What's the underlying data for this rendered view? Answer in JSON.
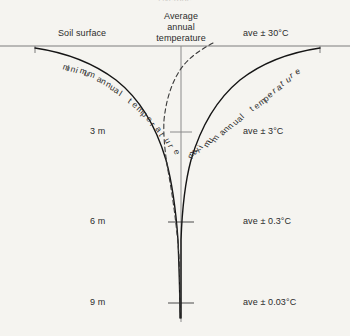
{
  "figure": {
    "background_color": "#f5f4f0",
    "ink_color": "#1a1a1a",
    "axis_color": "#8a8a8a",
    "top_clipped_text": "Average",
    "surface_label": "Soil surface",
    "average_label_lines": [
      "Average",
      "annual",
      "temperature"
    ],
    "curve_labels": {
      "minimum": "minimum annual temperature",
      "maximum": "maximum annual temperature"
    },
    "depth_labels": [
      {
        "label": "3 m",
        "amplitude": "ave ± 3°C"
      },
      {
        "label": "6 m",
        "amplitude": "ave ± 0.3°C"
      },
      {
        "label": "9 m",
        "amplitude": "ave ± 0.03°C"
      }
    ],
    "surface_amplitude": "ave ± 30°C"
  },
  "chart_data": {
    "type": "line",
    "title": "",
    "xlabel": "Temperature",
    "ylabel": "Depth",
    "ylim": [
      0,
      9.6
    ],
    "xlim": [
      -30,
      30
    ],
    "grid": false,
    "legend": "inline-curve-labels",
    "y_tick_labels": [
      "3 m",
      "6 m",
      "9 m"
    ],
    "y_ticks": [
      3,
      6,
      9
    ],
    "annotations": [
      {
        "text": "Soil surface",
        "depth_m": 0
      },
      {
        "text": "Average annual temperature",
        "depth_m": 0
      },
      {
        "text": "ave ± 30°C",
        "depth_m": 0
      },
      {
        "text": "ave ± 3°C",
        "depth_m": 3
      },
      {
        "text": "ave ± 0.3°C",
        "depth_m": 6
      },
      {
        "text": "ave ± 0.03°C",
        "depth_m": 9
      }
    ],
    "series": [
      {
        "name": "minimum annual temperature",
        "style": "solid",
        "depth_m": [
          0,
          0.5,
          1,
          1.5,
          2,
          2.5,
          3,
          3.5,
          4,
          4.5,
          5,
          5.5,
          6,
          7,
          8,
          9,
          9.5
        ],
        "deviation_c": [
          -30,
          -23.5,
          -18.5,
          -14.5,
          -11.4,
          -9,
          -7.1,
          -5.6,
          -4.4,
          -3.4,
          -2.7,
          -2.1,
          -1.7,
          -1.0,
          -0.6,
          -0.35,
          -0.2
        ]
      },
      {
        "name": "maximum annual temperature",
        "style": "solid",
        "depth_m": [
          0,
          0.5,
          1,
          1.5,
          2,
          2.5,
          3,
          3.5,
          4,
          4.5,
          5,
          5.5,
          6,
          7,
          8,
          9,
          9.5
        ],
        "deviation_c": [
          30,
          23.5,
          18.5,
          14.5,
          11.4,
          9,
          7.1,
          5.6,
          4.4,
          3.4,
          2.7,
          2.1,
          1.7,
          1.0,
          0.6,
          0.35,
          0.2
        ]
      },
      {
        "name": "average annual temperature",
        "style": "dashed",
        "depth_m": [
          0,
          0.4,
          0.9,
          1.4,
          2,
          2.6,
          3.2,
          4,
          4.8,
          5.6,
          6.4,
          7.2,
          8,
          9
        ],
        "deviation_c": [
          14,
          4,
          -5.5,
          -9.5,
          -8.8,
          -6.4,
          -4.2,
          -2.4,
          -1.4,
          -0.8,
          -0.5,
          -0.3,
          -0.2,
          -0.1
        ]
      }
    ]
  }
}
